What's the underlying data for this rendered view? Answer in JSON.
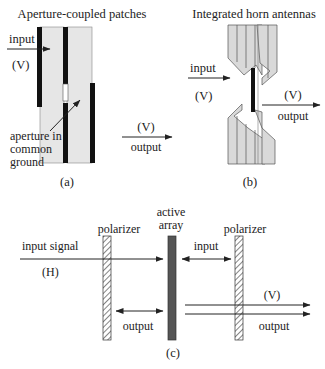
{
  "panel_a": {
    "title": "Aperture-coupled patches",
    "input_label": "input",
    "input_pol": "(V)",
    "output_pol": "(V)",
    "output_label": "output",
    "aperture_label_line1": "aperture in",
    "aperture_label_line2": "common",
    "aperture_label_line3": "ground",
    "caption": "(a)"
  },
  "panel_b": {
    "title": "Integrated horn antennas",
    "input_label": "input",
    "input_pol": "(V)",
    "output_pol": "(V)",
    "output_label": "output",
    "caption": "(b)"
  },
  "panel_c": {
    "left_polarizer_label": "polarizer",
    "active_array_line1": "active",
    "active_array_line2": "array",
    "right_polarizer_label": "polarizer",
    "input_signal_label": "input signal",
    "input_signal_pol": "(H)",
    "input_label": "input",
    "output_left_label": "output",
    "output_right_pol": "(V)",
    "output_right_label": "output",
    "caption": "(c)"
  },
  "colors": {
    "substrate_fill": "#e6e6e6",
    "horn_fill": "#d9d9d9",
    "conductor": "#111111",
    "active_array": "#555555",
    "line": "#222222"
  }
}
